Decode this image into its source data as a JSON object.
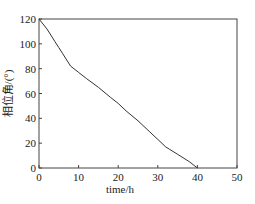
{
  "chart_data": {
    "type": "line",
    "title": "",
    "xlabel": "time/h",
    "ylabel": "相位角/(°)",
    "xlim": [
      0,
      50
    ],
    "ylim": [
      0,
      120
    ],
    "xticks": [
      0,
      10,
      20,
      30,
      40,
      50
    ],
    "yticks": [
      0,
      20,
      40,
      60,
      80,
      100,
      120
    ],
    "grid": false,
    "legend": null,
    "series": [
      {
        "name": "phase angle",
        "x": [
          0,
          1,
          2,
          3,
          4,
          5,
          6,
          7,
          8,
          10,
          12,
          15,
          18,
          20,
          22,
          25,
          28,
          30,
          32,
          33,
          35,
          38,
          40
        ],
        "y": [
          120,
          116,
          112,
          107,
          102,
          97,
          92,
          87,
          82,
          77,
          72,
          65,
          57,
          52,
          46,
          38,
          29,
          23,
          17,
          15,
          11,
          5,
          0
        ]
      }
    ]
  }
}
